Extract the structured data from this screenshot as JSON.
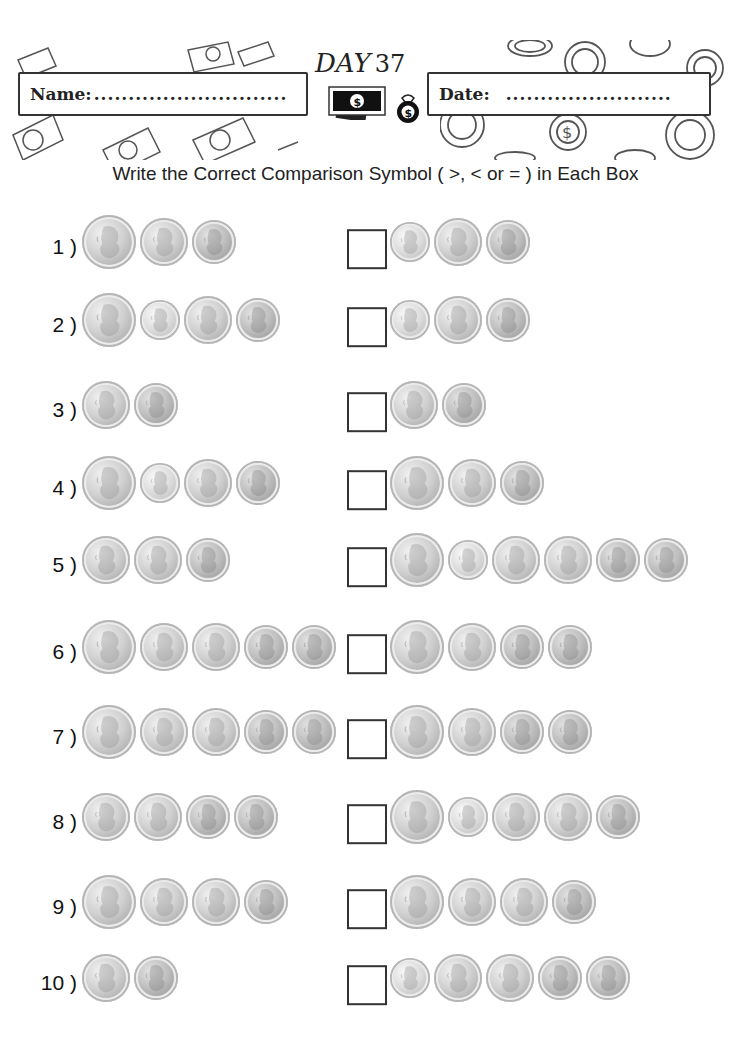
{
  "header": {
    "day_title": "DAY",
    "day_number": "37",
    "name_label": "Name:",
    "name_dots": "............................",
    "date_label": "Date:",
    "date_dots": "........................"
  },
  "instruction": "Write the Correct Comparison Symbol (  >, < or = ) in Each Box",
  "coin_values_cents": {
    "quarter": 25,
    "dime": 10,
    "nickel": 5,
    "penny": 1
  },
  "problems": [
    {
      "number": "1 )",
      "left": [
        "quarter",
        "nickel",
        "penny"
      ],
      "right": [
        "dime",
        "nickel",
        "penny"
      ],
      "answer": ""
    },
    {
      "number": "2 )",
      "left": [
        "quarter",
        "dime",
        "nickel",
        "penny"
      ],
      "right": [
        "dime",
        "nickel",
        "penny"
      ],
      "answer": ""
    },
    {
      "number": "3 )",
      "left": [
        "nickel",
        "penny"
      ],
      "right": [
        "nickel",
        "penny"
      ],
      "answer": ""
    },
    {
      "number": "4 )",
      "left": [
        "quarter",
        "dime",
        "nickel",
        "penny"
      ],
      "right": [
        "quarter",
        "nickel",
        "penny"
      ],
      "answer": ""
    },
    {
      "number": "5 )",
      "left": [
        "nickel",
        "nickel",
        "penny"
      ],
      "right": [
        "quarter",
        "dime",
        "nickel",
        "nickel",
        "penny",
        "penny"
      ],
      "answer": ""
    },
    {
      "number": "6 )",
      "left": [
        "quarter",
        "nickel",
        "nickel",
        "penny",
        "penny"
      ],
      "right": [
        "quarter",
        "nickel",
        "penny",
        "penny"
      ],
      "answer": ""
    },
    {
      "number": "7 )",
      "left": [
        "quarter",
        "nickel",
        "nickel",
        "penny",
        "penny"
      ],
      "right": [
        "quarter",
        "nickel",
        "penny",
        "penny"
      ],
      "answer": ""
    },
    {
      "number": "8 )",
      "left": [
        "nickel",
        "nickel",
        "penny",
        "penny"
      ],
      "right": [
        "quarter",
        "dime",
        "nickel",
        "nickel",
        "penny"
      ],
      "answer": ""
    },
    {
      "number": "9 )",
      "left": [
        "quarter",
        "nickel",
        "nickel",
        "penny"
      ],
      "right": [
        "quarter",
        "nickel",
        "nickel",
        "penny"
      ],
      "answer": ""
    },
    {
      "number": "10 )",
      "left": [
        "nickel",
        "penny"
      ],
      "right": [
        "dime",
        "nickel",
        "nickel",
        "penny",
        "penny"
      ],
      "answer": ""
    }
  ],
  "row_tops": [
    212,
    290,
    375,
    453,
    530,
    617,
    702,
    787,
    872,
    948
  ]
}
